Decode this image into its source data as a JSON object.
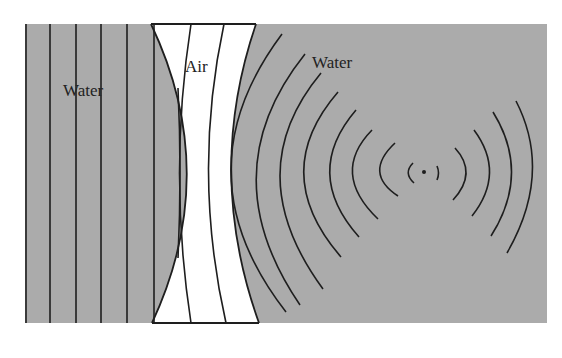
{
  "diagram": {
    "regions": [
      {
        "name": "left-water",
        "label": "Water"
      },
      {
        "name": "air-lens",
        "label": "Air"
      },
      {
        "name": "right-water",
        "label": "Water"
      }
    ],
    "colors": {
      "water": "#ababab",
      "air": "#ffffff",
      "lines": "#1e1e1e"
    },
    "source_point": {
      "x": 424,
      "y": 172
    }
  }
}
